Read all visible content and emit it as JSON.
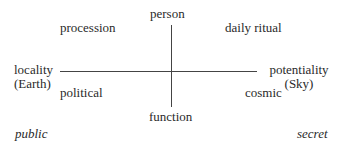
{
  "diagram": {
    "axes": {
      "top": "person",
      "bottom": "function",
      "left_line1": "locality",
      "left_line2": "(Earth)",
      "right_line1": "potentiality",
      "right_line2": "(Sky)"
    },
    "quadrants": {
      "top_left": "procession",
      "top_right": "daily ritual",
      "bottom_left": "political",
      "bottom_right": "cosmic"
    },
    "corners": {
      "bottom_left": "public",
      "bottom_right": "secret"
    },
    "colors": {
      "text": "#2a2a2a",
      "line": "#444444",
      "background": "#ffffff"
    }
  }
}
